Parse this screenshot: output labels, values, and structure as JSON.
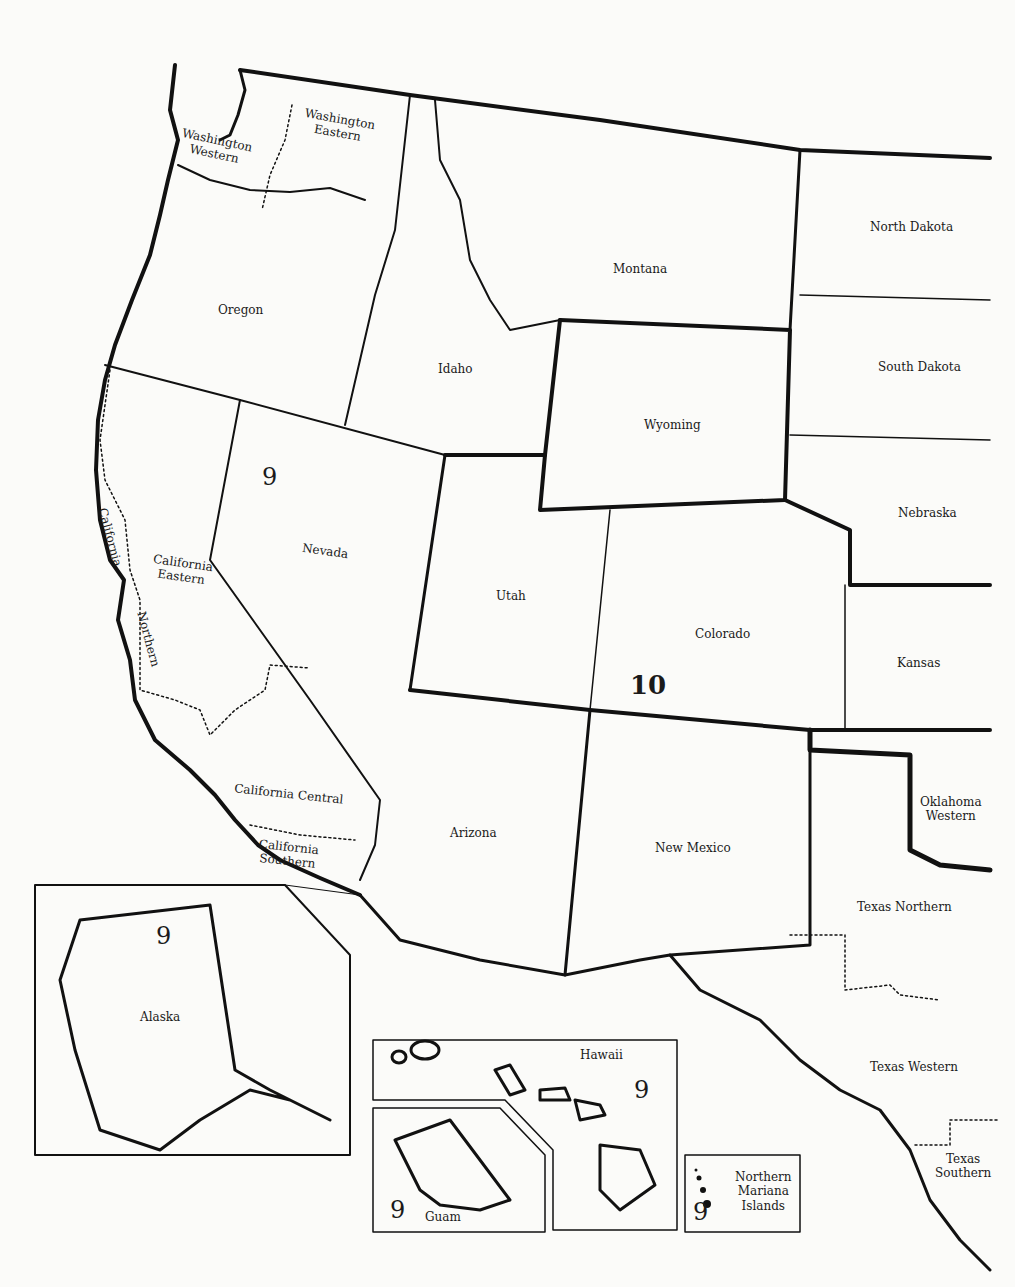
{
  "map": {
    "type": "US federal judicial circuits (western states)",
    "circuits": [
      {
        "number": "9",
        "label_positions": [
          "nevada-area",
          "alaska",
          "hawaii",
          "guam",
          "northern-mariana-islands"
        ]
      },
      {
        "number": "10",
        "label_positions": [
          "colorado-area"
        ]
      }
    ],
    "labels": {
      "wa_western": "Washington\nWestern",
      "wa_eastern": "Washington\nEastern",
      "montana": "Montana",
      "north_dakota": "North Dakota",
      "oregon": "Oregon",
      "idaho": "Idaho",
      "south_dakota": "South Dakota",
      "wyoming": "Wyoming",
      "nebraska": "Nebraska",
      "nevada": "Nevada",
      "utah": "Utah",
      "colorado": "Colorado",
      "kansas": "Kansas",
      "ca_northern_1": "California",
      "ca_northern_2": "Northern",
      "ca_eastern": "California\nEastern",
      "ca_central": "California Central",
      "ca_southern": "California\nSouthern",
      "arizona": "Arizona",
      "new_mexico": "New Mexico",
      "ok_western": "Oklahoma\nWestern",
      "tx_northern": "Texas Northern",
      "tx_western": "Texas Western",
      "tx_southern": "Texas\nSouthern",
      "alaska": "Alaska",
      "hawaii": "Hawaii",
      "guam": "Guam",
      "nmi": "Northern\nMariana\nIslands"
    },
    "numbers": {
      "nine_main": "9",
      "ten_main": "10",
      "nine_alaska": "9",
      "nine_hawaii": "9",
      "nine_guam": "9",
      "nine_nmi": "9"
    }
  }
}
